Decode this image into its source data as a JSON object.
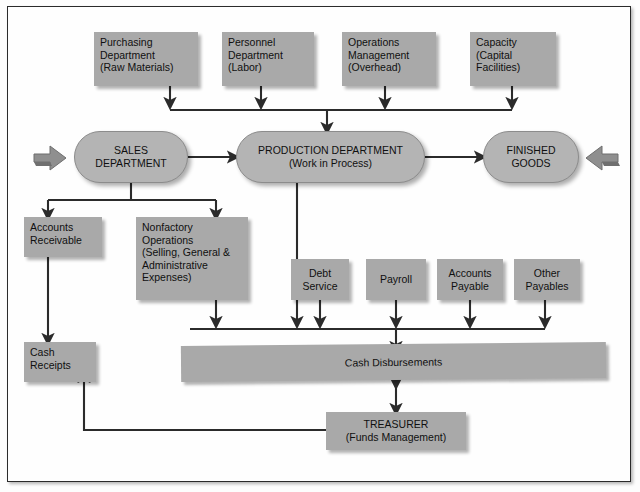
{
  "diagram": {
    "colors": {
      "box_fill": "#a9a9a9",
      "pill_fill": "#b4b4b4",
      "line": "#2b2b2b",
      "frame": "#2b2b2b",
      "background": "#fefefe"
    },
    "inputs": [
      {
        "id": "purchasing",
        "lines": [
          "Purchasing",
          "Department",
          "(Raw Materials)"
        ]
      },
      {
        "id": "personnel",
        "lines": [
          "Personnel",
          "Department",
          "(Labor)"
        ]
      },
      {
        "id": "operations",
        "lines": [
          "Operations",
          "Management",
          "(Overhead)"
        ]
      },
      {
        "id": "capacity",
        "lines": [
          "Capacity",
          "(Capital",
          "Facilities)"
        ]
      }
    ],
    "core": [
      {
        "id": "sales",
        "lines": [
          "SALES",
          "DEPARTMENT"
        ]
      },
      {
        "id": "production",
        "lines": [
          "PRODUCTION DEPARTMENT",
          "(Work in Process)"
        ]
      },
      {
        "id": "finished",
        "lines": [
          "FINISHED",
          "GOODS"
        ]
      }
    ],
    "sales_children": [
      {
        "id": "accounts-receivable",
        "lines": [
          "Accounts",
          "Receivable"
        ]
      },
      {
        "id": "nonfactory-operations",
        "lines": [
          "Nonfactory",
          "Operations",
          "(Selling, General &",
          "Administrative",
          "Expenses)"
        ]
      }
    ],
    "payables": [
      {
        "id": "debt-service",
        "lines": [
          "Debt",
          "Service"
        ]
      },
      {
        "id": "payroll",
        "lines": [
          "Payroll"
        ]
      },
      {
        "id": "accounts-payable",
        "lines": [
          "Accounts",
          "Payable"
        ]
      },
      {
        "id": "other-payables",
        "lines": [
          "Other",
          "Payables"
        ]
      }
    ],
    "bottom": [
      {
        "id": "cash-receipts",
        "lines": [
          "Cash",
          "Receipts"
        ]
      },
      {
        "id": "cash-disbursements",
        "lines": [
          "Cash Disbursements"
        ]
      },
      {
        "id": "treasurer",
        "lines": [
          "TREASURER",
          "(Funds Management)"
        ]
      }
    ],
    "block_arrows": [
      {
        "id": "inflow-arrow",
        "direction": "right"
      },
      {
        "id": "outflow-arrow",
        "direction": "left"
      }
    ]
  }
}
